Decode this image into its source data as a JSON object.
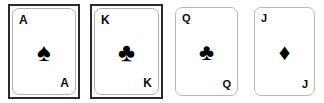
{
  "scene": {
    "description": "Row of four playing cards",
    "background_color": "#ffffff",
    "card_count": 4
  },
  "style": {
    "frame_color": "#2b2b2b",
    "inner_border_color": "#b9b9b9",
    "text_color": "#0b0b0b",
    "suit_color": "#000000",
    "card_face_color": "#ffffff"
  },
  "cards": [
    {
      "rank": "A",
      "rank_name": "Ace",
      "suit_name": "spades",
      "suit_glyph": "♠",
      "suit_color": "#000000",
      "has_outer_frame": true
    },
    {
      "rank": "K",
      "rank_name": "King",
      "suit_name": "clubs",
      "suit_glyph": "♣",
      "suit_color": "#000000",
      "has_outer_frame": true
    },
    {
      "rank": "Q",
      "rank_name": "Queen",
      "suit_name": "clubs",
      "suit_glyph": "♣",
      "suit_color": "#000000",
      "has_outer_frame": false
    },
    {
      "rank": "J",
      "rank_name": "Jack",
      "suit_name": "diamonds",
      "suit_glyph": "♦",
      "suit_color": "#000000",
      "has_outer_frame": false
    }
  ]
}
